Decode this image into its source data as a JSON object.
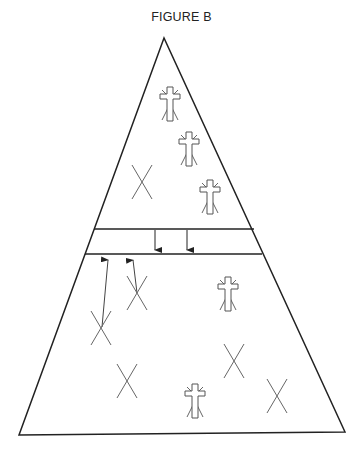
{
  "figure": {
    "title": "FIGURE B",
    "stroke_color": "#222222",
    "symbol_color": "#555555"
  },
  "diagram": {
    "shape": "triangle divided by a horizontal band",
    "regions": [
      {
        "name": "upper-region",
        "symbols": [
          {
            "type": "cross-with-rays",
            "x": 170,
            "y": 100
          },
          {
            "type": "cross-with-rays",
            "x": 189,
            "y": 145
          },
          {
            "type": "x-mark",
            "x": 142,
            "y": 182
          },
          {
            "type": "cross-with-rays",
            "x": 210,
            "y": 193
          }
        ]
      },
      {
        "name": "middle-band",
        "arrows": [
          {
            "direction": "down",
            "x": 155
          },
          {
            "direction": "down",
            "x": 187
          }
        ]
      },
      {
        "name": "lower-region",
        "symbols": [
          {
            "type": "x-mark",
            "x": 137,
            "y": 293
          },
          {
            "type": "cross-with-rays",
            "x": 228,
            "y": 290
          },
          {
            "type": "x-mark",
            "x": 101,
            "y": 327
          },
          {
            "type": "x-mark",
            "x": 234,
            "y": 361
          },
          {
            "type": "x-mark",
            "x": 127,
            "y": 381
          },
          {
            "type": "cross-with-rays",
            "x": 195,
            "y": 397
          },
          {
            "type": "x-mark",
            "x": 277,
            "y": 396
          }
        ],
        "arrows": [
          {
            "direction": "up",
            "from": [
              101,
              327
            ],
            "to": [
              108,
              256
            ]
          },
          {
            "direction": "up",
            "from": [
              137,
              293
            ],
            "to": [
              133,
              257
            ]
          }
        ]
      }
    ]
  }
}
